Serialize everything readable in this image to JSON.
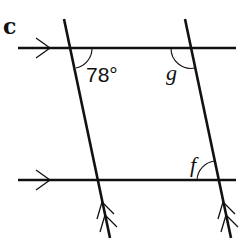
{
  "diagram": {
    "part_label": "c",
    "angles": {
      "known": "78°",
      "unknown_top_right": "g",
      "unknown_bottom_right": "f"
    },
    "lines": {
      "horizontal": [
        "top parallel line",
        "bottom parallel line"
      ],
      "transversal": [
        "left slanted line",
        "right slanted line"
      ]
    },
    "markers": {
      "horizontal_parallel": "single arrow",
      "transversal_parallel": "double arrow"
    },
    "colors": {
      "ink": "#111111",
      "background": "#ffffff"
    }
  }
}
